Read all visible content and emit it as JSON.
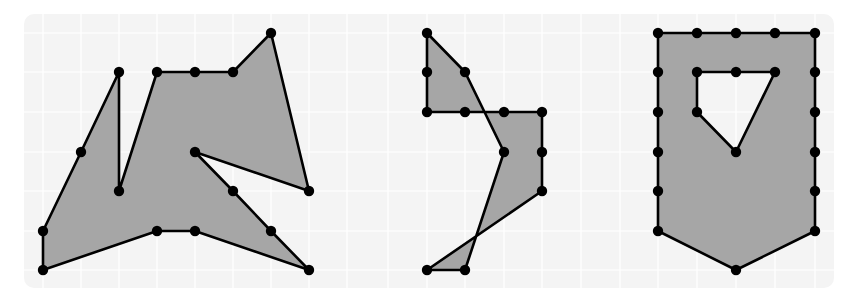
{
  "colors": {
    "background": "#ffffff",
    "grid_bg": "#f4f4f4",
    "grid_line": "#ffffff",
    "fill": "#a6a6a6",
    "stroke": "#000000",
    "vertex": "#000000"
  },
  "grid": {
    "x0": 24,
    "y0": 14,
    "x1": 834,
    "y1": 288,
    "xs": [
      43,
      81,
      119,
      157,
      195,
      233,
      271,
      309,
      347,
      388,
      427,
      465,
      504,
      542,
      581,
      620,
      658,
      697,
      736,
      775,
      815
    ],
    "ys": [
      33,
      72,
      112,
      152,
      191,
      231,
      270
    ]
  },
  "shapes": [
    {
      "name": "shape-1-irregular-polygon",
      "polygon": [
        [
          43,
          270
        ],
        [
          43,
          231
        ],
        [
          81,
          152
        ],
        [
          119,
          72
        ],
        [
          119,
          191
        ],
        [
          157,
          72
        ],
        [
          195,
          72
        ],
        [
          233,
          72
        ],
        [
          271,
          33
        ],
        [
          309,
          191
        ],
        [
          195,
          152
        ],
        [
          233,
          191
        ],
        [
          271,
          231
        ],
        [
          309,
          270
        ],
        [
          195,
          231
        ],
        [
          157,
          231
        ]
      ],
      "holes": [],
      "vertices": [
        [
          43,
          270
        ],
        [
          43,
          231
        ],
        [
          81,
          152
        ],
        [
          119,
          72
        ],
        [
          119,
          191
        ],
        [
          157,
          72
        ],
        [
          195,
          72
        ],
        [
          233,
          72
        ],
        [
          271,
          33
        ],
        [
          309,
          191
        ],
        [
          195,
          152
        ],
        [
          233,
          191
        ],
        [
          271,
          231
        ],
        [
          309,
          270
        ],
        [
          195,
          231
        ],
        [
          157,
          231
        ]
      ]
    },
    {
      "name": "shape-2-self-intersecting-polygon",
      "polygon": [
        [
          427,
          33
        ],
        [
          465,
          72
        ],
        [
          504,
          152
        ],
        [
          465,
          270
        ],
        [
          427,
          270
        ],
        [
          542,
          191
        ],
        [
          542,
          112
        ],
        [
          427,
          112
        ]
      ],
      "holes": [],
      "vertices": [
        [
          427,
          33
        ],
        [
          427,
          72
        ],
        [
          427,
          112
        ],
        [
          465,
          112
        ],
        [
          504,
          112
        ],
        [
          542,
          112
        ],
        [
          542,
          152
        ],
        [
          542,
          191
        ],
        [
          427,
          270
        ],
        [
          465,
          270
        ],
        [
          504,
          152
        ],
        [
          465,
          72
        ]
      ]
    },
    {
      "name": "shape-3-polygon-with-hole",
      "polygon": [
        [
          658,
          33
        ],
        [
          815,
          33
        ],
        [
          815,
          231
        ],
        [
          736,
          270
        ],
        [
          658,
          231
        ]
      ],
      "holes": [
        [
          [
            697,
            72
          ],
          [
            775,
            72
          ],
          [
            736,
            152
          ],
          [
            697,
            112
          ]
        ]
      ],
      "vertices": [
        [
          658,
          33
        ],
        [
          697,
          33
        ],
        [
          736,
          33
        ],
        [
          775,
          33
        ],
        [
          815,
          33
        ],
        [
          815,
          72
        ],
        [
          815,
          112
        ],
        [
          815,
          152
        ],
        [
          815,
          191
        ],
        [
          815,
          231
        ],
        [
          736,
          270
        ],
        [
          658,
          231
        ],
        [
          658,
          191
        ],
        [
          658,
          152
        ],
        [
          658,
          112
        ],
        [
          658,
          72
        ],
        [
          697,
          72
        ],
        [
          736,
          72
        ],
        [
          775,
          72
        ],
        [
          736,
          152
        ],
        [
          697,
          112
        ]
      ]
    }
  ]
}
